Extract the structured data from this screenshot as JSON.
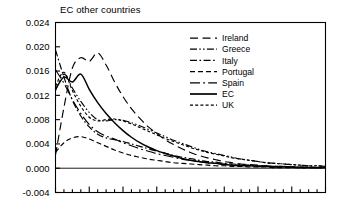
{
  "chart_data": {
    "type": "line",
    "title": "EC other countries",
    "xlabel": "",
    "ylabel": "",
    "ylim": [
      -0.004,
      0.024
    ],
    "yticks": [
      -0.004,
      0.0,
      0.004,
      0.008,
      0.012,
      0.016,
      0.02,
      0.024
    ],
    "ytick_labels": [
      "-0.004",
      "0.000",
      "0.004",
      "0.008",
      "0.012",
      "0.016",
      "0.020",
      "0.024"
    ],
    "xlim": [
      0,
      32
    ],
    "xticks_labeled": false,
    "xtick_count": 33,
    "xtick_major_every": 4,
    "grid": false,
    "legend_position": "top-right",
    "zero_line": true,
    "x": [
      0,
      1,
      2,
      3,
      4,
      5,
      6,
      7,
      8,
      9,
      10,
      11,
      12,
      13,
      14,
      15,
      16,
      17,
      18,
      19,
      20,
      21,
      22,
      23,
      24,
      25,
      26,
      27,
      28,
      29,
      30,
      31,
      32
    ],
    "series": [
      {
        "name": "Ireland",
        "style": "long-dash",
        "values": [
          0.0022,
          0.01,
          0.0165,
          0.0182,
          0.0176,
          0.019,
          0.017,
          0.0142,
          0.0118,
          0.0098,
          0.0082,
          0.0068,
          0.0057,
          0.0047,
          0.0039,
          0.0032,
          0.0026,
          0.0021,
          0.0017,
          0.0014,
          0.0011,
          0.0009,
          0.0007,
          0.0006,
          0.0005,
          0.0004,
          0.0003,
          0.0003,
          0.0002,
          0.0002,
          0.0002,
          0.0001,
          0.0001
        ]
      },
      {
        "name": "Greece",
        "style": "dash-dot-dot",
        "values": [
          0.0128,
          0.0155,
          0.0132,
          0.011,
          0.0092,
          0.008,
          0.0078,
          0.008,
          0.0079,
          0.0075,
          0.007,
          0.0064,
          0.0058,
          0.0052,
          0.0046,
          0.0041,
          0.0036,
          0.0031,
          0.0027,
          0.0024,
          0.0021,
          0.0018,
          0.0015,
          0.0013,
          0.0011,
          0.0009,
          0.0008,
          0.0007,
          0.0006,
          0.0005,
          0.0004,
          0.0004,
          0.0003
        ]
      },
      {
        "name": "Italy",
        "style": "dash-dot",
        "values": [
          0.0195,
          0.015,
          0.0112,
          0.0086,
          0.0068,
          0.0056,
          0.005,
          0.0047,
          0.0044,
          0.004,
          0.0036,
          0.0032,
          0.0028,
          0.0025,
          0.0021,
          0.0018,
          0.0016,
          0.0013,
          0.0011,
          0.001,
          0.0008,
          0.0007,
          0.0006,
          0.0005,
          0.0004,
          0.0004,
          0.0003,
          0.0003,
          0.0002,
          0.0002,
          0.0002,
          0.0001,
          0.0001
        ]
      },
      {
        "name": "Portugal",
        "style": "dash",
        "values": [
          0.0026,
          0.0042,
          0.005,
          0.0052,
          0.0048,
          0.0042,
          0.0036,
          0.003,
          0.0025,
          0.0021,
          0.0018,
          0.0015,
          0.0013,
          0.0011,
          0.0009,
          0.0008,
          0.0007,
          0.0006,
          0.0005,
          0.0004,
          0.0004,
          0.0003,
          0.0003,
          0.0002,
          0.0002,
          0.0002,
          0.0001,
          0.0001,
          0.0001,
          0.0001,
          0.0001,
          0.0001,
          0.0
        ]
      },
      {
        "name": "Spain",
        "style": "long-dash-dot",
        "values": [
          0.0162,
          0.014,
          0.0113,
          0.009,
          0.0072,
          0.006,
          0.0053,
          0.0048,
          0.0042,
          0.0037,
          0.0032,
          0.0028,
          0.0024,
          0.0021,
          0.0018,
          0.0015,
          0.0013,
          0.0011,
          0.0009,
          0.0008,
          0.0007,
          0.0006,
          0.0005,
          0.0004,
          0.0003,
          0.0003,
          0.0002,
          0.0002,
          0.0002,
          0.0001,
          0.0001,
          0.0001,
          0.0001
        ]
      },
      {
        "name": "EC",
        "style": "solid",
        "values": [
          0.013,
          0.015,
          0.0142,
          0.0155,
          0.013,
          0.0108,
          0.009,
          0.0075,
          0.0062,
          0.0051,
          0.0042,
          0.0035,
          0.0029,
          0.0024,
          0.002,
          0.0016,
          0.0013,
          0.0011,
          0.0009,
          0.0008,
          0.0006,
          0.0005,
          0.0004,
          0.0004,
          0.0003,
          0.0003,
          0.0002,
          0.0002,
          0.0002,
          0.0001,
          0.0001,
          0.0001,
          0.0001
        ]
      },
      {
        "name": "UK",
        "style": "short-dash",
        "values": [
          0.0135,
          0.0158,
          0.0128,
          0.0102,
          0.0084,
          0.0078,
          0.008,
          0.0081,
          0.0078,
          0.0073,
          0.0067,
          0.0061,
          0.0055,
          0.0049,
          0.0044,
          0.0039,
          0.0034,
          0.003,
          0.0026,
          0.0023,
          0.002,
          0.0017,
          0.0015,
          0.0013,
          0.0011,
          0.0009,
          0.0008,
          0.0007,
          0.0006,
          0.0005,
          0.0004,
          0.0004,
          0.0003
        ]
      }
    ],
    "legend": [
      {
        "label": "Ireland",
        "style": "long-dash"
      },
      {
        "label": "Greece",
        "style": "dash-dot-dot"
      },
      {
        "label": "Italy",
        "style": "dash-dot"
      },
      {
        "label": "Portugal",
        "style": "dash"
      },
      {
        "label": "Spain",
        "style": "long-dash-dot"
      },
      {
        "label": "EC",
        "style": "solid"
      },
      {
        "label": "UK",
        "style": "short-dash"
      }
    ],
    "colors": {
      "line": "#000000",
      "axis": "#000000",
      "background": "#ffffff"
    }
  }
}
